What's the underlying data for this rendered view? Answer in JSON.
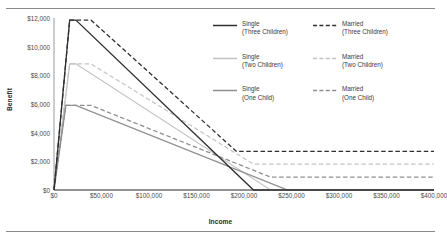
{
  "chart_data": {
    "type": "line",
    "title": "",
    "xlabel": "Income",
    "ylabel": "Benefit",
    "xlim": [
      0,
      400000
    ],
    "ylim": [
      0,
      12000
    ],
    "xticks": [
      "$0",
      "$50,000",
      "$100,000",
      "$150,000",
      "$200,000",
      "$250,000",
      "$300,000",
      "$350,000",
      "$400,000"
    ],
    "xtick_values": [
      0,
      50000,
      100000,
      150000,
      200000,
      250000,
      300000,
      350000,
      400000
    ],
    "yticks": [
      "$0",
      "$2,000",
      "$4,000",
      "$6,000",
      "$8,000",
      "$10,000",
      "$12,000"
    ],
    "ytick_values": [
      0,
      2000,
      4000,
      6000,
      8000,
      10000,
      12000
    ],
    "grid": false,
    "legend_position": "top-right",
    "colors": {
      "three_children": "#2f2f2f",
      "two_children": "#c3c3c3",
      "one_child": "#8f8f8f",
      "axis": "#9a9a9a",
      "text": "#3c3c3c"
    },
    "series": [
      {
        "name": "Single (Three Children)",
        "marital": "Single",
        "children": "Three Children",
        "style": "solid",
        "color": "#2f2f2f",
        "points": [
          [
            0,
            0
          ],
          [
            16500,
            11850
          ],
          [
            23000,
            11850
          ],
          [
            210000,
            0
          ],
          [
            400000,
            0
          ]
        ]
      },
      {
        "name": "Married (Three Children)",
        "marital": "Married",
        "children": "Three Children",
        "style": "dashed",
        "color": "#2f2f2f",
        "points": [
          [
            0,
            0
          ],
          [
            16500,
            11850
          ],
          [
            39000,
            11850
          ],
          [
            192000,
            2700
          ],
          [
            400000,
            2700
          ]
        ]
      },
      {
        "name": "Single (Two Children)",
        "marital": "Single",
        "children": "Two Children",
        "style": "solid",
        "color": "#c3c3c3",
        "points": [
          [
            0,
            0
          ],
          [
            16500,
            8800
          ],
          [
            23000,
            8800
          ],
          [
            228000,
            0
          ],
          [
            400000,
            0
          ]
        ]
      },
      {
        "name": "Married (Two Children)",
        "marital": "Married",
        "children": "Two Children",
        "style": "dashed",
        "color": "#c3c3c3",
        "points": [
          [
            0,
            0
          ],
          [
            16500,
            8800
          ],
          [
            39000,
            8800
          ],
          [
            210000,
            1800
          ],
          [
            400000,
            1800
          ]
        ]
      },
      {
        "name": "Single (One Child)",
        "marital": "Single",
        "children": "One Child",
        "style": "solid",
        "color": "#8f8f8f",
        "points": [
          [
            0,
            0
          ],
          [
            12500,
            5900
          ],
          [
            23000,
            5900
          ],
          [
            246000,
            0
          ],
          [
            400000,
            0
          ]
        ]
      },
      {
        "name": "Married (One Child)",
        "marital": "Married",
        "children": "One Child",
        "style": "dashed",
        "color": "#8f8f8f",
        "points": [
          [
            0,
            0
          ],
          [
            12500,
            5900
          ],
          [
            39000,
            5900
          ],
          [
            228000,
            900
          ],
          [
            400000,
            900
          ]
        ]
      }
    ]
  },
  "legend": {
    "entries": [
      {
        "marital": "Single",
        "children": "(Three Children)",
        "style": "solid",
        "color": "#2f2f2f"
      },
      {
        "marital": "Married",
        "children": "(Three Children)",
        "style": "dashed",
        "color": "#2f2f2f"
      },
      {
        "marital": "Single",
        "children": "(Two Children)",
        "style": "solid",
        "color": "#c3c3c3"
      },
      {
        "marital": "Married",
        "children": "(Two Children)",
        "style": "dashed",
        "color": "#c3c3c3"
      },
      {
        "marital": "Single",
        "children": "(One Child)",
        "style": "solid",
        "color": "#8f8f8f"
      },
      {
        "marital": "Married",
        "children": "(One Child)",
        "style": "dashed",
        "color": "#8f8f8f"
      }
    ]
  }
}
